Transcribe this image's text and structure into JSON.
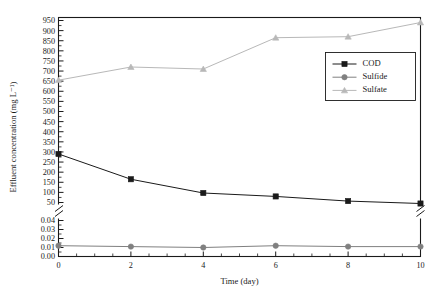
{
  "chart_data": {
    "type": "line",
    "title": "",
    "xlabel": "Time (day)",
    "ylabel": "Effluent concentration (mg L⁻¹)",
    "xlim": [
      0,
      10
    ],
    "x": [
      0,
      2,
      4,
      6,
      8,
      10
    ],
    "grid": false,
    "legend_position": "upper-right-inside",
    "broken_axis": true,
    "axis_sections": [
      {
        "name": "upper",
        "ylim": [
          50,
          950
        ],
        "tick_step": 50,
        "tick_labels": [
          "50",
          "100",
          "150",
          "200",
          "250",
          "300",
          "350",
          "400",
          "450",
          "500",
          "550",
          "600",
          "650",
          "700",
          "750",
          "800",
          "850",
          "900",
          "950"
        ],
        "tick_values": [
          50,
          100,
          150,
          200,
          250,
          300,
          350,
          400,
          450,
          500,
          550,
          600,
          650,
          700,
          750,
          800,
          850,
          900,
          950
        ]
      },
      {
        "name": "lower",
        "ylim": [
          0.0,
          0.04
        ],
        "tick_step": 0.01,
        "tick_labels": [
          "0.00",
          "0.01",
          "0.02",
          "0.03",
          "0.04"
        ],
        "tick_values": [
          0.0,
          0.01,
          0.02,
          0.03,
          0.04
        ]
      }
    ],
    "xtick_labels": [
      "0",
      "2",
      "4",
      "6",
      "8",
      "10"
    ],
    "xtick_values": [
      0,
      2,
      4,
      6,
      8,
      10
    ],
    "series": [
      {
        "name": "COD",
        "marker": "filled-square",
        "color": "#1a1a1a",
        "axis_section": "upper",
        "values": [
          290,
          165,
          97,
          80,
          57,
          45
        ]
      },
      {
        "name": "Sulfide",
        "marker": "filled-circle",
        "color": "#808080",
        "axis_section": "lower",
        "values": [
          0.012,
          0.011,
          0.01,
          0.012,
          0.011,
          0.011
        ]
      },
      {
        "name": "Sulfate",
        "marker": "filled-triangle",
        "color": "#b8b8b8",
        "axis_section": "upper",
        "values": [
          655,
          720,
          710,
          865,
          870,
          940
        ]
      }
    ]
  },
  "legend": {
    "entries": [
      {
        "label": "COD"
      },
      {
        "label": "Sulfide"
      },
      {
        "label": "Sulfate"
      }
    ]
  }
}
